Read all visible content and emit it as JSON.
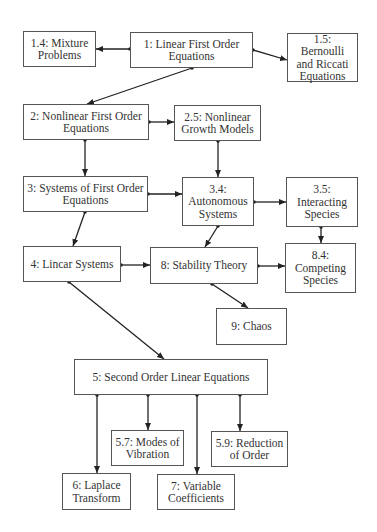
{
  "nodes": [
    {
      "id": "n1_4",
      "label": "1.4: Mixture\nProblems",
      "box": [
        23,
        31,
        73,
        36
      ]
    },
    {
      "id": "n1",
      "label": "1: Linear First Order\nEquations",
      "box": [
        130,
        32,
        123,
        36
      ]
    },
    {
      "id": "n1_5",
      "label": "1.5: Bernoulli\nand Riccati\nEquations",
      "box": [
        287,
        33,
        71,
        49
      ]
    },
    {
      "id": "n2",
      "label": "2: Nonlinear First Order\nEquations",
      "box": [
        23,
        104,
        126,
        36
      ]
    },
    {
      "id": "n2_5",
      "label": "2.5: Nonlinear\nGrowth Models",
      "box": [
        174,
        105,
        87,
        36
      ]
    },
    {
      "id": "n3",
      "label": "3: Systems of First Order\nEquations",
      "box": [
        23,
        176,
        125,
        36
      ]
    },
    {
      "id": "n3_4",
      "label": "3.4:\nAutonomous\nSystems",
      "box": [
        182,
        177,
        72,
        49
      ]
    },
    {
      "id": "n3_5",
      "label": "3.5:\nInteracting\nSpecies",
      "box": [
        286,
        177,
        72,
        50
      ]
    },
    {
      "id": "n4",
      "label": "4: Lincar Systems",
      "box": [
        23,
        246,
        98,
        36
      ]
    },
    {
      "id": "n8",
      "label": "8: Stability Theory",
      "box": [
        150,
        247,
        108,
        37
      ]
    },
    {
      "id": "n8_4",
      "label": "8.4:\nCompeting\nSpecies",
      "box": [
        285,
        243,
        71,
        50
      ]
    },
    {
      "id": "n9",
      "label": "9: Chaos",
      "box": [
        216,
        308,
        71,
        37
      ]
    },
    {
      "id": "n5",
      "label": "5: Second Order Linear Equations",
      "box": [
        74,
        359,
        194,
        36
      ]
    },
    {
      "id": "n5_7",
      "label": "5.7: Modes of\nVibration",
      "box": [
        111,
        430,
        73,
        36
      ]
    },
    {
      "id": "n5_9",
      "label": "5.9: Reduction\nof  Order",
      "box": [
        211,
        431,
        77,
        36
      ]
    },
    {
      "id": "n6",
      "label": "6: Laplace\nTransform",
      "box": [
        62,
        473,
        69,
        37
      ]
    },
    {
      "id": "n7",
      "label": "7: Variable\nCoefficients",
      "box": [
        157,
        474,
        78,
        36
      ]
    }
  ],
  "edges": [
    {
      "from": "n1",
      "to": "n1_4",
      "points": [
        130,
        49,
        96,
        49
      ]
    },
    {
      "from": "n1",
      "to": "n1_5",
      "points": [
        253,
        50,
        287,
        60
      ]
    },
    {
      "from": "n1",
      "to": "n2",
      "points": [
        192,
        68,
        87,
        104
      ]
    },
    {
      "from": "n2",
      "to": "n2_5",
      "points": [
        149,
        122,
        174,
        122
      ]
    },
    {
      "from": "n2",
      "to": "n3",
      "points": [
        85,
        140,
        85,
        176
      ]
    },
    {
      "from": "n2_5",
      "to": "n3_4",
      "points": [
        218,
        141,
        218,
        177
      ]
    },
    {
      "from": "n3",
      "to": "n3_4",
      "points": [
        148,
        194,
        182,
        194
      ]
    },
    {
      "from": "n3",
      "to": "n4",
      "points": [
        85,
        212,
        73,
        246
      ]
    },
    {
      "from": "n3_4",
      "to": "n3_5",
      "points": [
        254,
        202,
        286,
        202
      ]
    },
    {
      "from": "n3_4",
      "to": "n8",
      "points": [
        218,
        226,
        205,
        247
      ]
    },
    {
      "from": "n3_5",
      "to": "n8_4",
      "points": [
        321,
        227,
        321,
        243
      ]
    },
    {
      "from": "n4",
      "to": "n8",
      "points": [
        121,
        265,
        150,
        265
      ]
    },
    {
      "from": "n8",
      "to": "n8_4",
      "points": [
        258,
        266,
        285,
        266
      ]
    },
    {
      "from": "n8",
      "to": "n9",
      "points": [
        212,
        284,
        248,
        308
      ]
    },
    {
      "from": "n4",
      "to": "n5",
      "points": [
        69,
        282,
        164,
        359
      ]
    },
    {
      "from": "n5",
      "to": "n6",
      "points": [
        97,
        395,
        97,
        473
      ]
    },
    {
      "from": "n5",
      "to": "n5_7",
      "points": [
        148,
        395,
        148,
        430
      ]
    },
    {
      "from": "n5",
      "to": "n7",
      "points": [
        197,
        395,
        197,
        474
      ]
    },
    {
      "from": "n5",
      "to": "n5_9",
      "points": [
        240,
        395,
        240,
        431
      ]
    }
  ],
  "colors": {
    "line": "#222222",
    "border": "#555555",
    "text": "#333333"
  }
}
